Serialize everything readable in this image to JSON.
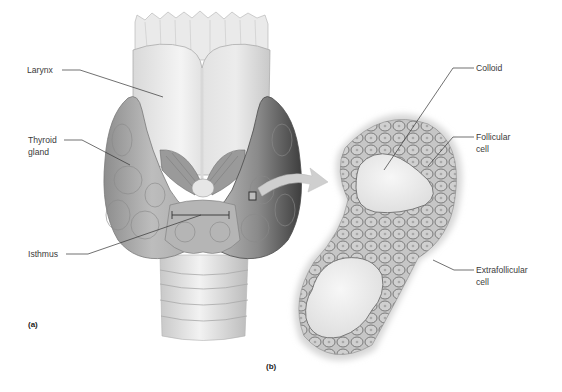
{
  "figure": {
    "panels": [
      {
        "id": "a",
        "label": "(a)",
        "subject": "thyroid-gland-anterior-view"
      },
      {
        "id": "b",
        "label": "(b)",
        "subject": "thyroid-follicles-histology"
      }
    ],
    "labels_a": {
      "larynx": "Larynx",
      "thyroid_gland": "Thyroid\ngland",
      "isthmus": "Isthmus"
    },
    "labels_b": {
      "colloid": "Colloid",
      "follicular_cell": "Follicular\ncell",
      "extrafollicular_cell": "Extrafollicular\ncell"
    },
    "panel_a_label": "(a)",
    "panel_b_label": "(b)",
    "colors": {
      "background": "#ffffff",
      "leader_line": "#333333",
      "tissue_light": "#e8e8e8",
      "tissue_mid": "#b8b8b8",
      "tissue_dark": "#5a5a5a",
      "cell_fill": "#c4c4c4",
      "cell_border": "#6e6e6e",
      "colloid": "#efefef",
      "arrow": "#cfcfcf"
    }
  }
}
